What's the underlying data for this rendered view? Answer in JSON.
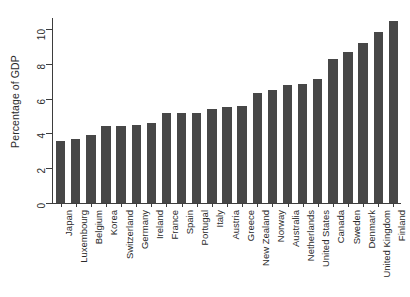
{
  "chart_data": {
    "type": "bar",
    "title": "",
    "subtitle": "",
    "xlabel": "",
    "ylabel": "Percentage of GDP",
    "ylim": [
      0,
      11
    ],
    "yticks": [
      0,
      2,
      4,
      6,
      8,
      10
    ],
    "ytick_labels": [
      "0",
      "2",
      "4",
      "6",
      "8",
      "10"
    ],
    "grid": false,
    "legend": null,
    "bar_color": "#474747",
    "axis_color": "#3d3d3d",
    "categories": [
      "Japan",
      "Luxembourg",
      "Belgium",
      "Korea",
      "Switzerland",
      "Germany",
      "Ireland",
      "France",
      "Spain",
      "Portugal",
      "Italy",
      "Austria",
      "Greece",
      "New Zealand",
      "Norway",
      "Australia",
      "Netherlands",
      "United States",
      "Canada",
      "Sweden",
      "Denmark",
      "United Kingdom",
      "Finland"
    ],
    "values": [
      3.55,
      3.7,
      3.9,
      4.4,
      4.4,
      4.5,
      4.6,
      5.15,
      5.15,
      5.2,
      5.4,
      5.5,
      5.6,
      6.35,
      6.5,
      6.8,
      6.85,
      7.1,
      8.25,
      8.7,
      9.2,
      9.8,
      10.45
    ]
  }
}
